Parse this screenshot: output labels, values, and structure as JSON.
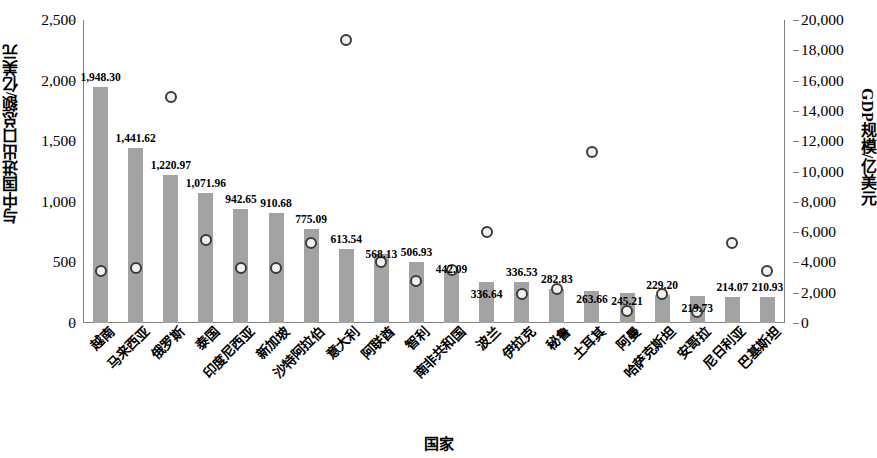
{
  "chart_data": {
    "type": "bar",
    "title": "",
    "xlabel": "国家",
    "ylabel": "与中国进出口总额/亿美元",
    "y2label": "GDP规模/亿美元",
    "ylim": [
      0,
      2500
    ],
    "y2lim": [
      0,
      20000
    ],
    "yticks": [
      "0",
      "500",
      "1,000",
      "1,500",
      "2,000",
      "2,500"
    ],
    "ytick_values": [
      0,
      500,
      1000,
      1500,
      2000,
      2500
    ],
    "y2ticks": [
      "0",
      "2,000",
      "4,000",
      "6,000",
      "8,000",
      "10,000",
      "12,000",
      "14,000",
      "16,000",
      "18,000",
      "20,000"
    ],
    "y2tick_values": [
      0,
      2000,
      4000,
      6000,
      8000,
      10000,
      12000,
      14000,
      16000,
      18000,
      20000
    ],
    "grid": false,
    "legend": "none",
    "bar_color": "#a3a3a3",
    "marker_edge_color": "#3b3b3b",
    "marker_fill_color": "#f2f2f2",
    "categories": [
      "越南",
      "马来西亚",
      "俄罗斯",
      "泰国",
      "印度尼西亚",
      "新加坡",
      "沙特阿拉伯",
      "意大利",
      "阿联酋",
      "智利",
      "南非共和国",
      "波兰",
      "伊拉克",
      "秘鲁",
      "土耳其",
      "阿曼",
      "哈萨克斯坦",
      "安哥拉",
      "尼日利亚",
      "巴基斯坦"
    ],
    "series": [
      {
        "name": "与中国进出口总额/亿美元",
        "type": "bar",
        "axis": "left",
        "values": [
          1948.3,
          1441.62,
          1220.97,
          1071.96,
          942.65,
          910.68,
          775.09,
          613.54,
          568.13,
          506.93,
          442.09,
          336.64,
          336.53,
          282.83,
          263.66,
          245.21,
          229.2,
          219.73,
          214.07,
          210.93
        ],
        "labels": [
          "1,948.30",
          "1,441.62",
          "1,220.97",
          "1,071.96",
          "942.65",
          "910.68",
          "775.09",
          "613.54",
          "568.13",
          "506.93",
          "442.09",
          "336.64",
          "336.53",
          "282.83",
          "263.66",
          "245.21",
          "229.20",
          "219.73",
          "214.07",
          "210.93"
        ]
      },
      {
        "name": "GDP规模/亿美元",
        "type": "scatter",
        "axis": "right",
        "values": [
          3400,
          3650,
          14900,
          5450,
          3600,
          3650,
          5300,
          18650,
          4050,
          2800,
          3500,
          6000,
          1900,
          2250,
          11300,
          800,
          1900,
          700,
          5300,
          3400
        ]
      }
    ]
  }
}
